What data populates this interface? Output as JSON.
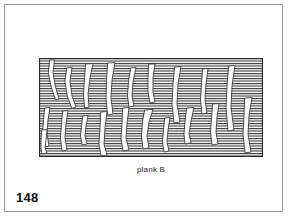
{
  "page": {
    "number": "148",
    "background_color": "#ffffff",
    "border_color": "#9a9a9a"
  },
  "figure": {
    "caption": "plank B",
    "label": "plank-b-diagram",
    "outline_color": "#2b2b2b",
    "hatch_color": "#3a3a3a",
    "fill_color": "#ffffff",
    "hatch_spacing_px": 2.5,
    "hatch_orientation": "horizontal",
    "rect": {
      "x": 0,
      "y": 0,
      "width": 224,
      "height": 99
    },
    "cracks": [
      {
        "name": "crack-1",
        "path": "M 11,2 L 15.5,2 L 14,14 L 16,27 L 20,41 L 16.5,42 L 12,28 L 9.5,15 Z"
      },
      {
        "name": "crack-2",
        "path": "M 28,10 L 33,9.5 L 31,23 L 33,38 L 37,49 L 33,50.5 L 28.5,39 L 26,24 Z"
      },
      {
        "name": "crack-3",
        "path": "M 47,6 L 54,5.5 L 51,20 L 49,36 L 50,49 L 45.5,50 L 44.5,36 L 45.5,20 Z"
      },
      {
        "name": "crack-4",
        "path": "M 69,5 L 76,4.5 L 73,22 L 72,40 L 74,56 L 68.5,57 L 67,40 L 67.5,22 Z"
      },
      {
        "name": "crack-5",
        "path": "M 92,10 L 97,9.5 L 94,24 L 93,38 L 95,48 L 90,49 L 88.5,38 L 89.5,24 Z"
      },
      {
        "name": "crack-6",
        "path": "M 110,6 L 116,6 L 114,20 L 114,34 L 116,44 L 111,45 L 109,34 L 109,20 Z"
      },
      {
        "name": "crack-7",
        "path": "M 136,9 L 142,8.5 L 139,26 L 138,46 L 141,64 L 135,65 L 133,46 L 134,26 Z"
      },
      {
        "name": "crack-8",
        "path": "M 164,11 L 169,10.5 L 167,26 L 166,42 L 168,55 L 163,56 L 161.5,42 L 162.5,26 Z"
      },
      {
        "name": "crack-9",
        "path": "M 190,8 L 196,7.5 L 193,28 L 192,50 L 195,72 L 189,73 L 187,50 L 188,28 Z"
      },
      {
        "name": "crack-10",
        "path": "M 6,50 L 11,49.5 L 9,62 L 8,76 L 10,88 L 5,89 L 3.5,76 L 4.5,62 Z"
      },
      {
        "name": "crack-11",
        "path": "M 24,53 L 29,52.5 L 27,66 L 26,80 L 28,92 L 23,93 L 21.5,80 L 22.5,66 Z"
      },
      {
        "name": "crack-12",
        "path": "M 44,58 L 49,57.5 L 47,68 L 46,78 L 48,86 L 43,87 L 41.5,78 L 42.5,68 Z"
      },
      {
        "name": "crack-13",
        "path": "M 62,54 L 68,53.5 L 66,70 L 65,86 L 68,97 L 62,98 L 60,86 L 61,70 Z"
      },
      {
        "name": "crack-14",
        "path": "M 84,50 L 90,49.5 L 88,66 L 87,80 L 90,92 L 84,93 L 82,80 L 83,66 Z"
      },
      {
        "name": "crack-15",
        "path": "M 106,52 L 114,51.5 L 110,64 L 108,78 L 110,90 L 104,91 L 102.5,78 L 103.5,64 Z"
      },
      {
        "name": "crack-16",
        "path": "M 148,50 L 155,49.5 L 152,63 L 150,76 L 152,85 L 146,86 L 145,76 L 146,63 Z"
      },
      {
        "name": "crack-17",
        "path": "M 174,46 L 180,45.5 L 178,60 L 177,74 L 179,86 L 173,87 L 171.5,74 L 172.5,60 Z"
      },
      {
        "name": "crack-18",
        "path": "M 3,72 L 8,71.5 L 7,82 L 6,90 L 8,95 L 3,96 L 2,90 L 2,82 Z"
      },
      {
        "name": "crack-19",
        "path": "M 126,60 L 131,59.5 L 129,72 L 128,84 L 130,93 L 125,94 L 123.5,84 L 124.5,72 Z"
      },
      {
        "name": "crack-20",
        "path": "M 206,40 L 213,39.5 L 210,58 L 209,76 L 212,94 L 206,95 L 204,76 L 205,58 Z"
      }
    ]
  }
}
